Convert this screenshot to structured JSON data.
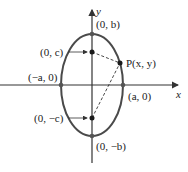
{
  "diagram": {
    "type": "ellipse-with-foci",
    "axes": {
      "x_label": "x",
      "y_label": "y"
    },
    "points": {
      "vertex_top": "(0, b)",
      "vertex_bottom": "(0, −b)",
      "vertex_left": "(−a, 0)",
      "vertex_right": "(a, 0)",
      "focus_upper": "(0, c)",
      "focus_lower": "(0, −c)",
      "point_p": "P(x, y)"
    },
    "colors": {
      "ellipse": "#4a4a4a",
      "axes": "#333333",
      "points": "#1a1a1a",
      "text": "#222222"
    }
  }
}
